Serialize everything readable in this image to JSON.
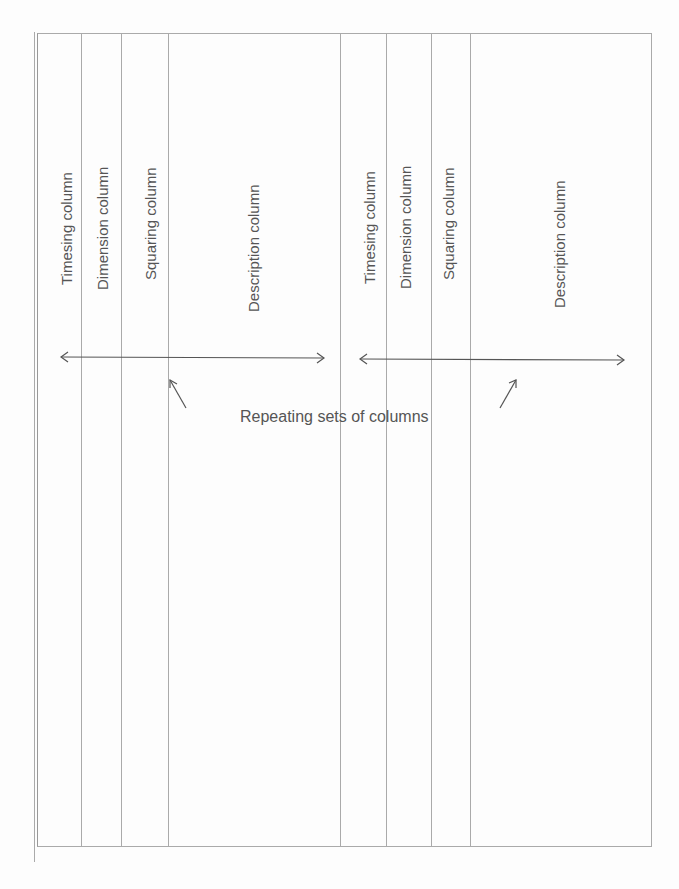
{
  "diagram": {
    "column_sets": [
      {
        "columns": [
          {
            "label": "Timesing column"
          },
          {
            "label": "Dimension column"
          },
          {
            "label": "Squaring column"
          },
          {
            "label": "Description column"
          }
        ]
      },
      {
        "columns": [
          {
            "label": "Timesing column"
          },
          {
            "label": "Dimension column"
          },
          {
            "label": "Squaring column"
          },
          {
            "label": "Description column"
          }
        ]
      }
    ],
    "annotation": "Repeating sets of columns",
    "line_color": "#aaaaaa",
    "text_color": "#555555"
  }
}
